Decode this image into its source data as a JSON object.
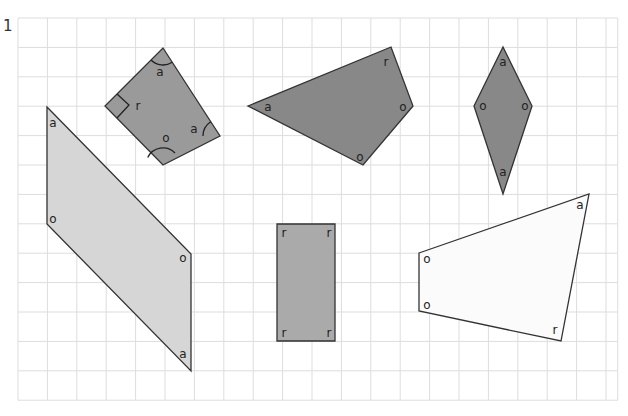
{
  "question_number": "1",
  "grid": {
    "x0": 18,
    "y0": 18,
    "cell": 29.4,
    "cols": 20.4,
    "rows": 13,
    "line_color": "#dddddd"
  },
  "shapes": [
    {
      "name": "kite-rotated",
      "fill": "#9a9a9a",
      "points": [
        [
          163,
          48
        ],
        [
          220,
          136
        ],
        [
          163,
          165
        ],
        [
          105,
          106
        ]
      ],
      "angle_labels": [
        {
          "text": "a",
          "x": 160,
          "y": 76
        },
        {
          "text": "r",
          "x": 138,
          "y": 110
        },
        {
          "text": "a",
          "x": 194,
          "y": 133
        },
        {
          "text": "o",
          "x": 166,
          "y": 142
        }
      ]
    },
    {
      "name": "quadrilateral-dark",
      "fill": "#888888",
      "points": [
        [
          248,
          106
        ],
        [
          391,
          47
        ],
        [
          413,
          106
        ],
        [
          363,
          165
        ]
      ],
      "angle_labels": [
        {
          "text": "a",
          "x": 268,
          "y": 111
        },
        {
          "text": "r",
          "x": 386,
          "y": 66
        },
        {
          "text": "o",
          "x": 403,
          "y": 111
        },
        {
          "text": "o",
          "x": 360,
          "y": 161
        }
      ]
    },
    {
      "name": "rhombus",
      "fill": "#888888",
      "points": [
        [
          503,
          47
        ],
        [
          532,
          106
        ],
        [
          503,
          194
        ],
        [
          474,
          106
        ]
      ],
      "angle_labels": [
        {
          "text": "a",
          "x": 503,
          "y": 66
        },
        {
          "text": "o",
          "x": 483,
          "y": 110
        },
        {
          "text": "o",
          "x": 525,
          "y": 110
        },
        {
          "text": "a",
          "x": 503,
          "y": 176
        }
      ]
    },
    {
      "name": "parallelogram",
      "fill": "#d6d6d6",
      "points": [
        [
          47,
          107
        ],
        [
          191,
          254
        ],
        [
          191,
          371
        ],
        [
          47,
          224
        ]
      ],
      "angle_labels": [
        {
          "text": "a",
          "x": 53,
          "y": 127
        },
        {
          "text": "o",
          "x": 53,
          "y": 223
        },
        {
          "text": "o",
          "x": 183,
          "y": 262
        },
        {
          "text": "a",
          "x": 183,
          "y": 358
        }
      ]
    },
    {
      "name": "rectangle",
      "fill": "#aaaaaa",
      "points": [
        [
          277,
          224
        ],
        [
          335,
          224
        ],
        [
          335,
          341
        ],
        [
          277,
          341
        ]
      ],
      "angle_labels": [
        {
          "text": "r",
          "x": 284,
          "y": 237
        },
        {
          "text": "r",
          "x": 329,
          "y": 237
        },
        {
          "text": "r",
          "x": 284,
          "y": 337
        },
        {
          "text": "r",
          "x": 329,
          "y": 337
        }
      ]
    },
    {
      "name": "quadrilateral-light",
      "fill": "#fbfbfb",
      "points": [
        [
          419,
          253
        ],
        [
          589,
          194
        ],
        [
          561,
          341
        ],
        [
          419,
          311
        ]
      ],
      "angle_labels": [
        {
          "text": "a",
          "x": 580,
          "y": 209
        },
        {
          "text": "o",
          "x": 427,
          "y": 263
        },
        {
          "text": "o",
          "x": 427,
          "y": 309
        },
        {
          "text": "r",
          "x": 555,
          "y": 334
        }
      ]
    }
  ],
  "angle_arcs": [
    {
      "cx": 163,
      "cy": 48,
      "r": 17,
      "a1": 57,
      "a2": 135
    },
    {
      "cx": 220,
      "cy": 136,
      "r": 17,
      "a1": 180,
      "a2": 237
    },
    {
      "cx": 163,
      "cy": 165,
      "r": 17,
      "a1": 206,
      "a2": 315
    }
  ],
  "right_angle_mark": {
    "points": [
      [
        117,
        94
      ],
      [
        129,
        105
      ],
      [
        117,
        118
      ]
    ]
  }
}
